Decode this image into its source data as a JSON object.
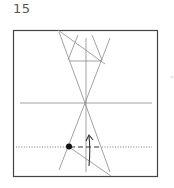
{
  "step": {
    "number": "15"
  },
  "diagram": {
    "colors": {
      "paper_edge": "#444444",
      "crease": "#8a8a8a",
      "reference_point": "#111111"
    },
    "symbols": [
      "valley-fold-line",
      "fold-arrow",
      "reference-dot",
      "dotted-guide-line"
    ]
  }
}
